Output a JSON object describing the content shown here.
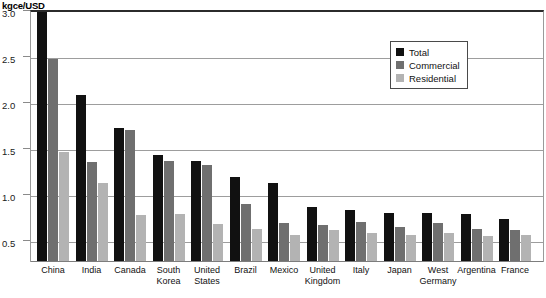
{
  "chart_data": {
    "type": "bar",
    "title": "",
    "unit_label": "kgce/USD",
    "xlabel": "",
    "ylabel": "kgce/USD",
    "ylim": [
      0,
      3.0
    ],
    "ytick_values": [
      0.5,
      1.0,
      1.5,
      2.0,
      2.5,
      3.0
    ],
    "ytick_labels": [
      "0.5",
      "1.0",
      "1.5",
      "2.0",
      "2.5",
      "3.0"
    ],
    "grid": true,
    "legend_position": "upper right",
    "categories": [
      "China",
      "India",
      "Canada",
      "South Korea",
      "United States",
      "Brazil",
      "Mexico",
      "United Kingdom",
      "Italy",
      "Japan",
      "West Germany",
      "Argentina",
      "France"
    ],
    "series": [
      {
        "name": "Total",
        "color": "#111111",
        "values": [
          2.86,
          1.82,
          1.46,
          1.16,
          1.1,
          0.92,
          0.86,
          0.6,
          0.56,
          0.53,
          0.53,
          0.52,
          0.47
        ]
      },
      {
        "name": "Commercial",
        "color": "#6f6f6f",
        "values": [
          2.21,
          1.09,
          1.44,
          1.1,
          1.05,
          0.63,
          0.42,
          0.4,
          0.44,
          0.38,
          0.42,
          0.36,
          0.35
        ]
      },
      {
        "name": "Residential",
        "color": "#b3b3b3",
        "values": [
          1.2,
          0.86,
          0.51,
          0.52,
          0.41,
          0.36,
          0.29,
          0.35,
          0.32,
          0.29,
          0.31,
          0.28,
          0.29
        ]
      }
    ]
  },
  "legend": {
    "items": [
      {
        "label": "Total",
        "swatch": "total-swatch"
      },
      {
        "label": "Commercial",
        "swatch": "commercial-swatch"
      },
      {
        "label": "Residential",
        "swatch": "residential-swatch"
      }
    ]
  }
}
